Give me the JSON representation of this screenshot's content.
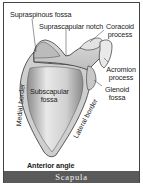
{
  "figure": {
    "caption": "Scapula",
    "labels": {
      "supraspinous_fossa": "Supraspinous fossa",
      "suprascapular_notch": "Suprascapular notch",
      "coracoid_process_1": "Coracoid",
      "coracoid_process_2": "process",
      "acromion_process_1": "Acromion",
      "acromion_process_2": "process",
      "glenoid_fossa_1": "Glenoid",
      "glenoid_fossa_2": "fossa",
      "subscapular_fossa_1": "Subscapular",
      "subscapular_fossa_2": "fossa",
      "medial_border": "Medial border",
      "lateral_border": "Lateral border",
      "anterior_angle": "Anterior angle"
    },
    "colors": {
      "caption_bg": "#5a5a5a",
      "caption_text": "#f2f2f2",
      "bone_light": "#e6e6e6",
      "bone_dark": "#9a9a9a",
      "outline": "#333333"
    }
  }
}
